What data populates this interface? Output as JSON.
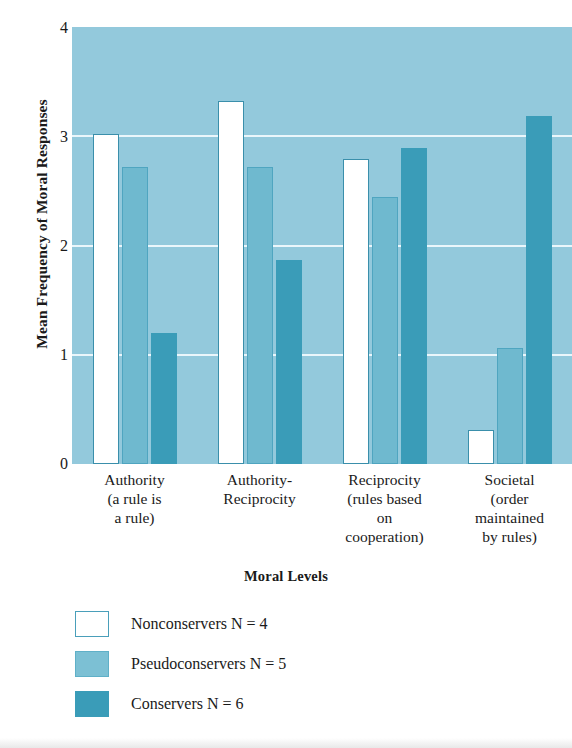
{
  "chart_data": {
    "type": "bar",
    "title": "",
    "xlabel": "Moral Levels",
    "ylabel": "Mean Frequency of Moral Responses",
    "ylim": [
      0,
      4
    ],
    "yticks": [
      0,
      1,
      2,
      3,
      4
    ],
    "ytick_labels": [
      "0",
      "1",
      "2",
      "3",
      "4"
    ],
    "grid": true,
    "grid_axis": "y",
    "legend_position": "below-plot-left",
    "categories": [
      "Authority\n(a rule is\na rule)",
      "Authority-\nReciprocity",
      "Reciprocity\n(rules based\non\ncooperation)",
      "Societal\n(order\nmaintained\nby rules)"
    ],
    "category_lines": [
      [
        "Authority",
        "(a rule is",
        "a rule)"
      ],
      [
        "Authority-",
        "Reciprocity"
      ],
      [
        "Reciprocity",
        "(rules based",
        "on",
        "cooperation)"
      ],
      [
        "Societal",
        "(order",
        "maintained",
        "by rules)"
      ]
    ],
    "series": [
      {
        "name": "Nonconservers",
        "n": 4,
        "n_label": "N = 4",
        "color": "#ffffff",
        "values": [
          3.02,
          3.32,
          2.79,
          0.31
        ]
      },
      {
        "name": "Pseudoconservers",
        "n": 5,
        "n_label": "N = 5",
        "color": "#7cc0d4",
        "values": [
          2.72,
          2.72,
          2.44,
          1.06
        ]
      },
      {
        "name": "Conservers",
        "n": 6,
        "n_label": "N = 6",
        "color": "#3a9cb8",
        "values": [
          1.2,
          1.87,
          2.89,
          3.19
        ]
      }
    ]
  },
  "axes": {
    "y_title": "Mean Frequency of Moral Responses",
    "x_title": "Moral Levels",
    "y_tick_labels": [
      "4",
      "3",
      "2",
      "1",
      "0"
    ]
  },
  "legend": {
    "entries": [
      {
        "swatch": "nonconservers",
        "label": "Nonconservers  N = 4"
      },
      {
        "swatch": "pseudoconservers",
        "label": "Pseudoconservers N = 5"
      },
      {
        "swatch": "conservers",
        "label": "Conservers  N = 6"
      }
    ]
  },
  "colors": {
    "plot_background": "#93c9dc",
    "gridline": "#eaf6fb",
    "nonconservers": "#ffffff",
    "nonconservers_border": "#3a8fab",
    "pseudoconservers": "#6fb9cf",
    "conservers": "#3a9cb8",
    "text": "#1a1a1a"
  }
}
